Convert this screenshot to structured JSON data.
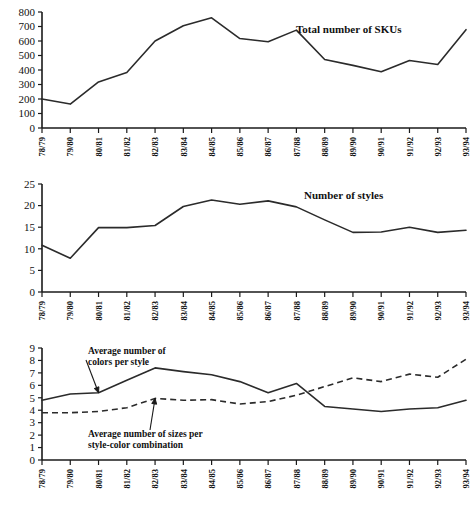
{
  "categories": [
    "78/79",
    "79/80",
    "80/81",
    "81/82",
    "82/83",
    "83/84",
    "84/85",
    "85/86",
    "86/87",
    "87/88",
    "88/89",
    "89/90",
    "90/91",
    "91/92",
    "92/93",
    "93/94"
  ],
  "figure": {
    "ghost_title": "",
    "background": "#ffffff",
    "line_color": "#2b2b2b"
  },
  "chart_data": [
    {
      "id": "skus",
      "type": "line",
      "title": "Total number of SKUs",
      "xlabel": "",
      "ylabel": "",
      "ylim": [
        0,
        800
      ],
      "yticks": [
        0,
        100,
        200,
        300,
        400,
        500,
        600,
        700,
        800
      ],
      "ytick_labels": [
        "0",
        "100",
        "200",
        "300",
        "400",
        "500",
        "600",
        "700",
        "800"
      ],
      "grid": false,
      "legend_position": "inside-right",
      "categories": [
        "78/79",
        "79/80",
        "80/81",
        "81/82",
        "82/83",
        "83/84",
        "84/85",
        "85/86",
        "86/87",
        "87/88",
        "88/89",
        "89/90",
        "90/91",
        "91/92",
        "92/93",
        "93/94"
      ],
      "series": [
        {
          "name": "Total number of SKUs",
          "style": "solid",
          "values": [
            200,
            165,
            318,
            383,
            600,
            705,
            760,
            617,
            595,
            675,
            472,
            432,
            388,
            466,
            438,
            678
          ]
        }
      ]
    },
    {
      "id": "styles",
      "type": "line",
      "title": "Number of styles",
      "xlabel": "",
      "ylabel": "",
      "ylim": [
        0,
        25
      ],
      "yticks": [
        0,
        5,
        10,
        15,
        20,
        25
      ],
      "ytick_labels": [
        "0",
        "5",
        "10",
        "15",
        "20",
        "25"
      ],
      "grid": false,
      "legend_position": "inside-right",
      "categories": [
        "78/79",
        "79/80",
        "80/81",
        "81/82",
        "82/83",
        "83/84",
        "84/85",
        "85/86",
        "86/87",
        "87/88",
        "88/89",
        "89/90",
        "90/91",
        "91/92",
        "92/93",
        "93/94"
      ],
      "series": [
        {
          "name": "Number of styles",
          "style": "solid",
          "values": [
            10.8,
            7.8,
            14.9,
            14.9,
            15.4,
            19.8,
            21.3,
            20.3,
            21.1,
            19.7,
            16.7,
            13.8,
            13.9,
            15.0,
            13.8,
            14.3
          ]
        }
      ]
    },
    {
      "id": "averages",
      "type": "line",
      "title": "",
      "xlabel": "",
      "ylabel": "",
      "ylim": [
        0,
        9
      ],
      "yticks": [
        0,
        1,
        2,
        3,
        4,
        5,
        6,
        7,
        8,
        9
      ],
      "ytick_labels": [
        "0",
        "1",
        "2",
        "3",
        "4",
        "5",
        "6",
        "7",
        "8",
        "9"
      ],
      "grid": false,
      "legend_position": "annotations",
      "categories": [
        "78/79",
        "79/80",
        "80/81",
        "81/82",
        "82/83",
        "83/84",
        "84/85",
        "85/86",
        "86/87",
        "87/88",
        "88/89",
        "89/90",
        "90/91",
        "91/92",
        "92/93",
        "93/94"
      ],
      "series": [
        {
          "name": "Average number of colors per style",
          "style": "solid",
          "values": [
            4.8,
            5.3,
            5.4,
            6.4,
            7.4,
            7.1,
            6.85,
            6.3,
            5.4,
            6.15,
            4.3,
            4.1,
            3.9,
            4.1,
            4.2,
            4.8
          ]
        },
        {
          "name": "Average number of sizes per style-color combination",
          "style": "dashed",
          "values": [
            3.8,
            3.8,
            3.9,
            4.2,
            4.95,
            4.8,
            4.85,
            4.5,
            4.7,
            5.2,
            5.9,
            6.6,
            6.3,
            6.9,
            6.65,
            8.1
          ]
        }
      ],
      "annotations": [
        {
          "id": "colors-annotation",
          "text_line1": "Average number of",
          "text_line2": "colors per style",
          "target_index": 2
        },
        {
          "id": "sizes-annotation",
          "text_line1": "Average number of sizes per",
          "text_line2": "style-color combination",
          "target_index": 4
        }
      ]
    }
  ]
}
